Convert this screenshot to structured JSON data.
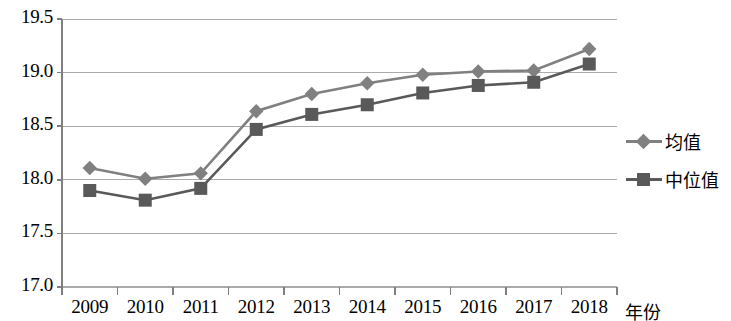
{
  "chart_data": {
    "type": "line",
    "title": "",
    "xlabel": "年份",
    "ylabel": "",
    "categories": [
      "2009",
      "2010",
      "2011",
      "2012",
      "2013",
      "2014",
      "2015",
      "2016",
      "2017",
      "2018"
    ],
    "series": [
      {
        "name": "均值",
        "marker": "diamond",
        "color": "#808080",
        "values": [
          18.11,
          18.01,
          18.06,
          18.64,
          18.8,
          18.9,
          18.98,
          19.01,
          19.02,
          19.22
        ]
      },
      {
        "name": "中位值",
        "marker": "square",
        "color": "#595959",
        "values": [
          17.9,
          17.81,
          17.92,
          18.47,
          18.61,
          18.7,
          18.81,
          18.88,
          18.91,
          19.08
        ]
      }
    ],
    "ylim": [
      17.0,
      19.5
    ],
    "yticks": [
      "17.0",
      "17.5",
      "18.0",
      "18.5",
      "19.0",
      "19.5"
    ],
    "ytick_values": [
      17.0,
      17.5,
      18.0,
      18.5,
      19.0,
      19.5
    ],
    "grid": true,
    "legend_position": "right",
    "axis_color": "#7f7f7f",
    "grid_color": "#aaaaaa",
    "background": "#ffffff"
  },
  "legend": {
    "items": [
      {
        "label": "均值"
      },
      {
        "label": "中位值"
      }
    ]
  }
}
